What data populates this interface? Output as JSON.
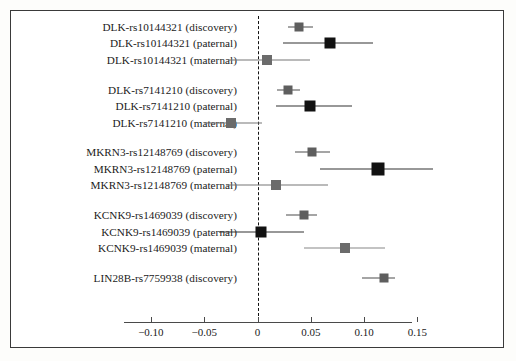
{
  "figure": {
    "type": "forest-plot",
    "background_color": "#ffffff",
    "frame_color": "#3a3a3a"
  },
  "chart_data": {
    "type": "scatter",
    "title": "",
    "xlabel": "",
    "ylabel": "",
    "xlim": [
      -0.125,
      0.145
    ],
    "xticks": [
      -0.1,
      -0.05,
      0,
      0.05,
      0.1,
      0.15
    ],
    "xtick_labels": [
      "−0.10",
      "−0.05",
      "0",
      "0.05",
      "0.10",
      "0.15"
    ],
    "grid": false,
    "legend": null,
    "reference_line": 0,
    "reference_line_style": "dashed",
    "groups": [
      {
        "name": "DLK-rs10144321",
        "rows": [
          {
            "label": "DLK-rs10144321 (discovery)",
            "estimate": 0.039,
            "ci_low": 0.029,
            "ci_high": 0.052,
            "marker_style": "gray-square",
            "marker_color": "#5e5e5e",
            "marker_size": 9,
            "line_color": "#4d4d4d"
          },
          {
            "label": "DLK-rs10144321 (paternal)",
            "estimate": 0.068,
            "ci_low": 0.024,
            "ci_high": 0.108,
            "marker_style": "black-square",
            "marker_color": "#111111",
            "marker_size": 11,
            "line_color": "#333333"
          },
          {
            "label": "DLK-rs10144321 (maternal)",
            "estimate": 0.009,
            "ci_low": -0.028,
            "ci_high": 0.049,
            "marker_style": "gray-square",
            "marker_color": "#6b6b6b",
            "marker_size": 10,
            "line_color": "#777777"
          }
        ]
      },
      {
        "name": "DLK-rs7141210",
        "rows": [
          {
            "label": "DLK-rs7141210 (discovery)",
            "estimate": 0.029,
            "ci_low": 0.018,
            "ci_high": 0.04,
            "marker_style": "gray-square",
            "marker_color": "#5e5e5e",
            "marker_size": 9,
            "line_color": "#4d4d4d"
          },
          {
            "label": "DLK-rs7141210 (paternal)",
            "estimate": 0.049,
            "ci_low": 0.017,
            "ci_high": 0.089,
            "marker_style": "black-square",
            "marker_color": "#111111",
            "marker_size": 11,
            "line_color": "#333333"
          },
          {
            "label": "DLK-rs7141210 (maternal)",
            "estimate": -0.025,
            "ci_low": -0.05,
            "ci_high": 0.004,
            "marker_style": "gray-square",
            "marker_color": "#6b6b6b",
            "marker_size": 10,
            "line_color": "#777777"
          }
        ]
      },
      {
        "name": "MKRN3-rs12148769",
        "rows": [
          {
            "label": "MKRN3-rs12148769 (discovery)",
            "estimate": 0.051,
            "ci_low": 0.035,
            "ci_high": 0.068,
            "marker_style": "gray-square",
            "marker_color": "#5e5e5e",
            "marker_size": 9,
            "line_color": "#4d4d4d"
          },
          {
            "label": "MKRN3-rs12148769 (paternal)",
            "estimate": 0.113,
            "ci_low": 0.059,
            "ci_high": 0.165,
            "marker_style": "black-square",
            "marker_color": "#111111",
            "marker_size": 13,
            "line_color": "#333333"
          },
          {
            "label": "MKRN3-rs12148769 (maternal)",
            "estimate": 0.017,
            "ci_low": -0.03,
            "ci_high": 0.066,
            "marker_style": "gray-square",
            "marker_color": "#6b6b6b",
            "marker_size": 10,
            "line_color": "#777777"
          }
        ]
      },
      {
        "name": "KCNK9-rs1469039",
        "rows": [
          {
            "label": "KCNK9-rs1469039 (discovery)",
            "estimate": 0.044,
            "ci_low": 0.027,
            "ci_high": 0.056,
            "marker_style": "gray-square",
            "marker_color": "#5e5e5e",
            "marker_size": 9,
            "line_color": "#4d4d4d"
          },
          {
            "label": "KCNK9-rs1469039 (paternal)",
            "estimate": 0.003,
            "ci_low": -0.036,
            "ci_high": 0.044,
            "marker_style": "black-square",
            "marker_color": "#111111",
            "marker_size": 11,
            "line_color": "#333333"
          },
          {
            "label": "KCNK9-rs1469039 (maternal)",
            "estimate": 0.082,
            "ci_low": 0.044,
            "ci_high": 0.12,
            "marker_style": "gray-square",
            "marker_color": "#6b6b6b",
            "marker_size": 10,
            "line_color": "#888888"
          }
        ]
      },
      {
        "name": "LIN28B-rs7759938",
        "rows": [
          {
            "label": "LIN28B-rs7759938 (discovery)",
            "estimate": 0.119,
            "ci_low": 0.098,
            "ci_high": 0.129,
            "marker_style": "gray-square",
            "marker_color": "#5e5e5e",
            "marker_size": 9,
            "line_color": "#4d4d4d"
          }
        ]
      }
    ]
  }
}
